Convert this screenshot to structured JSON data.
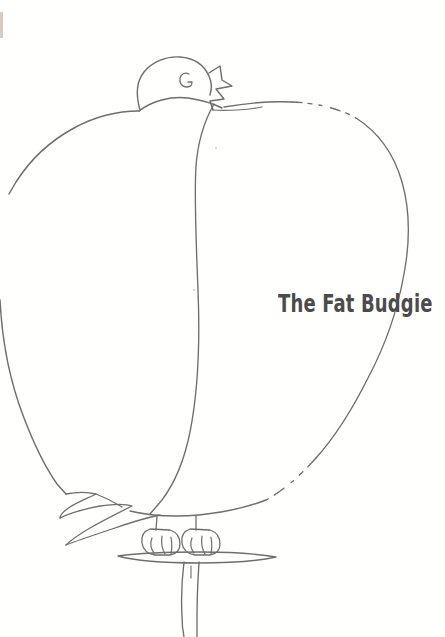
{
  "page": {
    "kind": "line-drawing-illustration",
    "background_color": "#ffffff",
    "ink_color": "#6e6e6e",
    "ink_color_dark": "#585858",
    "title_color": "#4b4b4b",
    "edge_speck_color": "#b08878",
    "width": 445,
    "height": 637
  },
  "title": {
    "text": "The Fat Budgie"
  },
  "illustration": {
    "subject": "fat budgie perched on a stand",
    "head": {
      "eye_glyph": "G"
    },
    "parts": [
      "head",
      "eye",
      "beak",
      "body",
      "wing",
      "tail-feathers",
      "left-foot",
      "right-foot",
      "perch-bar",
      "perch-post"
    ]
  }
}
